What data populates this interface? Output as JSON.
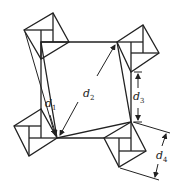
{
  "diagram": {
    "type": "geometric-figure",
    "stroke_color": "#222222",
    "labels": {
      "d1": {
        "base": "d",
        "sub": "1"
      },
      "d2": {
        "base": "d",
        "sub": "2"
      },
      "d3": {
        "base": "d",
        "sub": "3"
      },
      "d4": {
        "base": "d",
        "sub": "4"
      }
    }
  }
}
